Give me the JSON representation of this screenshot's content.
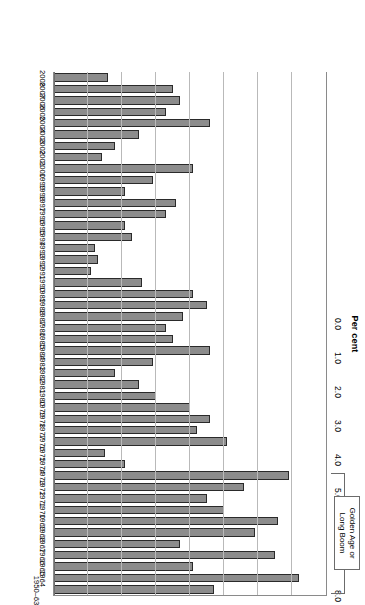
{
  "chart_data": {
    "type": "bar",
    "orientation": "horizontal",
    "title": "",
    "xlabel": "Per cent",
    "ylabel": "",
    "xlim": [
      0.0,
      8.0
    ],
    "xticks": [
      "0.0",
      "1.0",
      "2.0",
      "3.0",
      "4.0",
      "5.0",
      "6.0",
      "7.0",
      "8.0"
    ],
    "grid": true,
    "legend": "none",
    "categories": [
      "1950–63",
      "1964",
      "1965",
      "1966",
      "1967",
      "1968",
      "1969",
      "1970",
      "1971",
      "1972",
      "1973",
      "1974",
      "1975",
      "1976",
      "1977",
      "1978",
      "1979",
      "1980",
      "1981",
      "1982",
      "1983",
      "1984",
      "1985",
      "1986",
      "1987",
      "1988",
      "1989",
      "1990",
      "1991",
      "1992",
      "1993",
      "1994",
      "1995",
      "1996",
      "1997",
      "1998",
      "1999",
      "2000",
      "2001",
      "2002",
      "2003",
      "2004",
      "2005",
      "2006",
      "2007",
      "2008"
    ],
    "values": [
      4.7,
      7.2,
      4.1,
      6.5,
      3.7,
      5.9,
      6.6,
      5.0,
      4.5,
      5.6,
      6.9,
      2.1,
      1.5,
      5.1,
      4.2,
      4.6,
      4.0,
      3.0,
      2.5,
      1.8,
      2.9,
      4.6,
      3.5,
      3.3,
      3.8,
      4.5,
      4.1,
      2.6,
      1.1,
      1.3,
      1.2,
      2.3,
      2.1,
      3.3,
      3.6,
      2.1,
      2.9,
      4.1,
      1.4,
      1.8,
      2.5,
      4.6,
      3.3,
      3.7,
      3.5,
      1.6
    ],
    "series": [
      {
        "name": "Annual average growth rate",
        "values": [
          4.7,
          7.2,
          4.1,
          6.5,
          3.7,
          5.9,
          6.6,
          5.0,
          4.5,
          5.6,
          6.9,
          2.1,
          1.5,
          5.1,
          4.2,
          4.6,
          4.0,
          3.0,
          2.5,
          1.8,
          2.9,
          4.6,
          3.5,
          3.3,
          3.8,
          4.5,
          4.1,
          2.6,
          1.1,
          1.3,
          1.2,
          2.3,
          2.1,
          3.3,
          3.6,
          2.1,
          2.9,
          4.1,
          1.4,
          1.8,
          2.5,
          4.6,
          3.3,
          3.7,
          3.5,
          1.6
        ],
        "color": "#8c8c8c"
      }
    ],
    "annotations": [
      {
        "text_line1": "Golden Age or",
        "text_line2": "Long Boom",
        "spans_categories": [
          "1950–63",
          "1973"
        ],
        "style": "bracket"
      }
    ]
  },
  "axis": {
    "value_axis_title": "Per cent",
    "tick_labels": [
      "8.0",
      "7.0",
      "6.0",
      "5.0",
      "4.0",
      "3.0",
      "2.0",
      "1.0",
      "0.0"
    ]
  },
  "annotation": {
    "line1": "Golden Age or",
    "line2": "Long Boom"
  },
  "colors": {
    "bar_fill": "#8c8c8c",
    "bar_stroke": "#2a2a2a",
    "gridline": "#b9b9b9",
    "axis": "#8a8a8a",
    "text": "#000000",
    "background": "#ffffff"
  }
}
